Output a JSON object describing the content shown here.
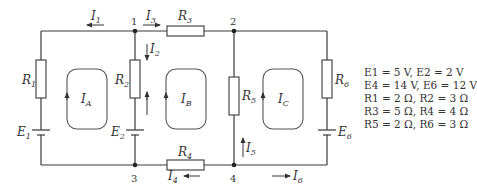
{
  "diagram": {
    "type": "electric-circuit",
    "nodes": [
      "1",
      "2",
      "3",
      "4"
    ],
    "currents": {
      "I1": "I1",
      "I2": "I2",
      "I3": "I3",
      "I4": "I4",
      "I5": "I5",
      "I6": "I6"
    },
    "loop_currents": [
      "IA",
      "IB",
      "IC"
    ],
    "components": {
      "resistors": [
        "R1",
        "R2",
        "R3",
        "R4",
        "R5",
        "R6"
      ],
      "sources": [
        "E1",
        "E2",
        "E6"
      ]
    }
  },
  "parameters": [
    "E1 = 5 V, E2 = 2 V",
    "E4 = 14 V, E6 = 12 V",
    "R1 = 2 Ω, R2 = 3 Ω",
    "R3 = 5 Ω, R4 = 4 Ω",
    "R5 = 2 Ω, R6 = 3 Ω"
  ],
  "labels": {
    "node1": "1",
    "node2": "2",
    "node3": "3",
    "node4": "4"
  }
}
